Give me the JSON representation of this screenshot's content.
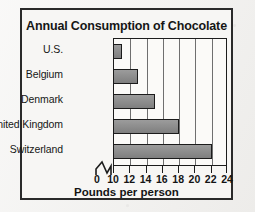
{
  "chart_data": {
    "type": "bar",
    "orientation": "horizontal",
    "title": "Annual Consumption of Chocolate",
    "xlabel": "Pounds per person",
    "ylabel": "",
    "categories": [
      "U.S.",
      "Belgium",
      "Denmark",
      "United Kingdom",
      "Switzerland"
    ],
    "values": [
      11,
      13,
      15,
      18,
      22
    ],
    "xlim": [
      10,
      24
    ],
    "xticks": [
      0,
      10,
      12,
      14,
      16,
      18,
      20,
      22,
      24
    ],
    "xtick_labels": [
      "0",
      "10",
      "12",
      "14",
      "16",
      "18",
      "20",
      "22",
      "24"
    ],
    "axis_break": true,
    "axis_break_between": [
      0,
      10
    ],
    "grid": true,
    "gridlines_at": [
      10,
      12,
      14,
      16,
      18,
      20,
      22,
      24
    ],
    "legend": null,
    "bar_color": "#8d8d8d",
    "bar_edge_color": "#1b1b1b",
    "plot_background": "#fbfaf8",
    "figure_background": "#f2f1ef",
    "frame_color": "#2a2a2a"
  }
}
